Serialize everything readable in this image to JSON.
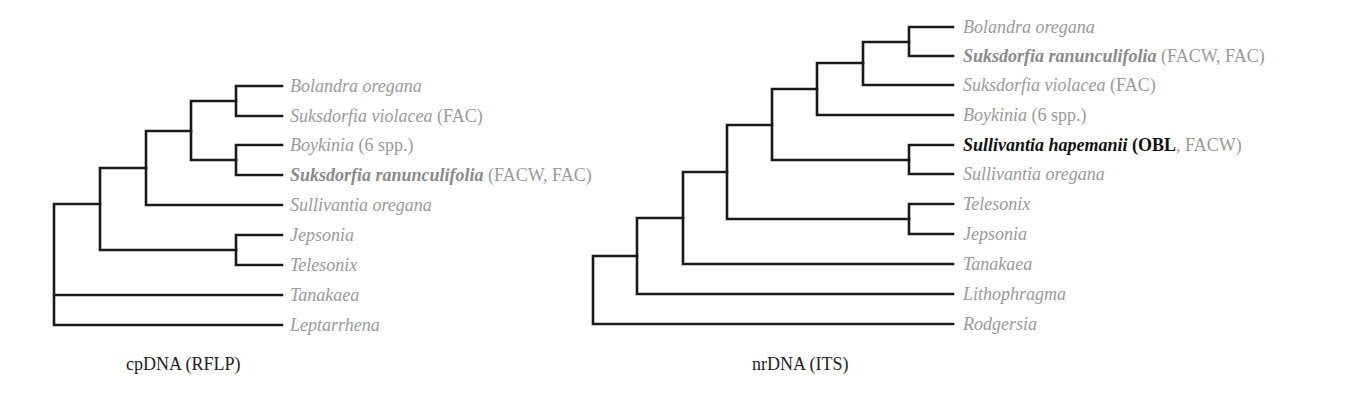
{
  "colors": {
    "branch": "#1a1a1a",
    "label": "#9a9a9a",
    "highlight": "#111111"
  },
  "trees": [
    {
      "caption": "cpDNA (RFLP)",
      "leaves": [
        {
          "taxon": "Bolandra oregana",
          "note": ""
        },
        {
          "taxon": "Suksdorfia violacea",
          "note": " (FAC)"
        },
        {
          "taxon": "Boykinia",
          "note": " (6 spp.)"
        },
        {
          "taxon": "Suksdorfia ranunculifolia",
          "note": " (FACW, FAC)",
          "bold": true
        },
        {
          "taxon": "Sullivantia oregana",
          "note": ""
        },
        {
          "taxon": "Jepsonia",
          "note": ""
        },
        {
          "taxon": "Telesonix",
          "note": ""
        },
        {
          "taxon": "Tanakaea",
          "note": ""
        },
        {
          "taxon": "Leptarrhena",
          "note": ""
        }
      ]
    },
    {
      "caption": "nrDNA (ITS)",
      "leaves": [
        {
          "taxon": "Bolandra oregana",
          "note": ""
        },
        {
          "taxon": "Suksdorfia ranunculifolia",
          "note": " (FACW, FAC)",
          "bold": true
        },
        {
          "taxon": "Suksdorfia violacea",
          "note": " (FAC)"
        },
        {
          "taxon": "Boykinia",
          "note": " (6 spp.)"
        },
        {
          "taxon": "Sullivantia hapemanii",
          "note_open": " (",
          "note_bold": "OBL",
          "note_rest": ", FACW)",
          "bold": true,
          "dark": true
        },
        {
          "taxon": "Sullivantia oregana",
          "note": ""
        },
        {
          "taxon": "Telesonix",
          "note": ""
        },
        {
          "taxon": "Jepsonia",
          "note": ""
        },
        {
          "taxon": "Tanakaea",
          "note": ""
        },
        {
          "taxon": "Lithophragma",
          "note": ""
        },
        {
          "taxon": "Rodgersia",
          "note": ""
        }
      ]
    }
  ]
}
